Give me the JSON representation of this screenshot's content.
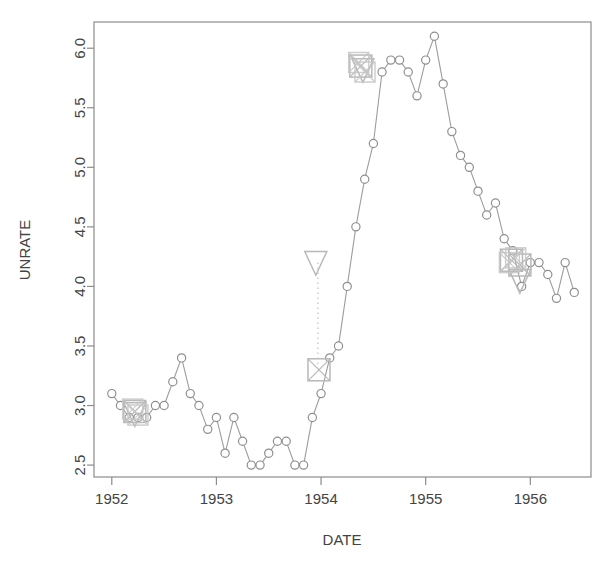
{
  "chart_data": {
    "type": "line",
    "title": "",
    "xlabel": "DATE",
    "ylabel": "UNRATE",
    "xlim": [
      1951.83,
      1956.58
    ],
    "ylim": [
      2.4,
      6.22
    ],
    "grid": false,
    "legend": "none",
    "x_ticks": [
      "1952",
      "1953",
      "1954",
      "1955",
      "1956"
    ],
    "x_tick_values": [
      1952,
      1953,
      1954,
      1955,
      1956
    ],
    "y_ticks": [
      "2.5",
      "3.0",
      "3.5",
      "4.0",
      "4.5",
      "5.0",
      "5.5",
      "6.0"
    ],
    "y_tick_values": [
      2.5,
      3.0,
      3.5,
      4.0,
      4.5,
      5.0,
      5.5,
      6.0
    ],
    "series": [
      {
        "name": "UNRATE",
        "marker": "circle",
        "color": "#9a9a9a",
        "x": [
          1952.0,
          1952.083,
          1952.167,
          1952.25,
          1952.333,
          1952.417,
          1952.5,
          1952.583,
          1952.667,
          1952.75,
          1952.833,
          1952.917,
          1953.0,
          1953.083,
          1953.167,
          1953.25,
          1953.333,
          1953.417,
          1953.5,
          1953.583,
          1953.667,
          1953.75,
          1953.833,
          1953.917,
          1954.0,
          1954.083,
          1954.167,
          1954.25,
          1954.333,
          1954.417,
          1954.5,
          1954.583,
          1954.667,
          1954.75,
          1954.833,
          1954.917,
          1955.0,
          1955.083,
          1955.167,
          1955.25,
          1955.333,
          1955.417,
          1955.5,
          1955.583,
          1955.667,
          1955.75,
          1955.833,
          1955.917,
          1956.0,
          1956.083,
          1956.167,
          1956.25,
          1956.333
        ],
        "y": [
          3.1,
          3.0,
          2.9,
          2.9,
          2.9,
          3.0,
          3.0,
          3.2,
          3.4,
          3.1,
          3.0,
          2.8,
          2.9,
          2.6,
          2.9,
          2.7,
          2.5,
          2.5,
          2.6,
          2.7,
          2.7,
          2.5,
          2.5,
          2.9,
          3.1,
          3.4,
          3.5,
          4.0,
          4.5,
          4.9,
          5.2,
          5.8,
          5.9,
          5.9,
          5.8,
          5.6,
          5.9,
          6.1,
          5.7,
          5.3,
          5.1,
          5.0,
          4.8,
          4.6,
          4.7,
          4.4,
          4.3,
          4.0,
          4.2,
          4.2,
          4.1,
          3.9,
          4.2
        ],
        "final_point": {
          "x": 1956.42,
          "y": 3.95
        }
      }
    ],
    "annotations": [
      {
        "type": "square-x",
        "x": 1952.22,
        "y": 2.95,
        "color": "#b9b9b9",
        "size": "large",
        "label": "cluster-1952"
      },
      {
        "type": "triangle-down",
        "x": 1952.22,
        "y": 2.93,
        "color": "#b9b9b9",
        "size": "large",
        "label": "cluster-1952"
      },
      {
        "type": "triangle-down",
        "x": 1953.95,
        "y": 4.2,
        "color": "#b9b9b9",
        "size": "large",
        "label": "marker-1954-triangle"
      },
      {
        "type": "square-x",
        "x": 1953.98,
        "y": 3.3,
        "color": "#b9b9b9",
        "size": "large",
        "label": "marker-1954-square"
      },
      {
        "type": "connector-dotted",
        "x": 1953.97,
        "y0": 4.2,
        "y1": 3.3,
        "color": "#c4c4c4",
        "label": "dotted-connector"
      },
      {
        "type": "square-x",
        "x": 1954.38,
        "y": 5.85,
        "color": "#b9b9b9",
        "size": "large",
        "label": "cluster-peak"
      },
      {
        "type": "triangle-down",
        "x": 1954.4,
        "y": 5.82,
        "color": "#b9b9b9",
        "size": "large",
        "label": "cluster-peak"
      },
      {
        "type": "square-x",
        "x": 1955.82,
        "y": 4.22,
        "color": "#b9b9b9",
        "size": "large",
        "label": "cluster-1956"
      },
      {
        "type": "square-x",
        "x": 1955.9,
        "y": 4.18,
        "color": "#b9b9b9",
        "size": "large",
        "label": "cluster-1956"
      },
      {
        "type": "triangle-down",
        "x": 1955.9,
        "y": 4.05,
        "color": "#b9b9b9",
        "size": "large",
        "label": "cluster-1956"
      }
    ]
  },
  "axes": {
    "y_label": "UNRATE",
    "x_label": "DATE"
  },
  "style": {
    "line_color": "#9d9d9d",
    "marker_stroke": "#8f8f8f",
    "annotation_color": "#b9b9b9",
    "box_color": "#8c8c8c",
    "text_color": "#444444"
  }
}
